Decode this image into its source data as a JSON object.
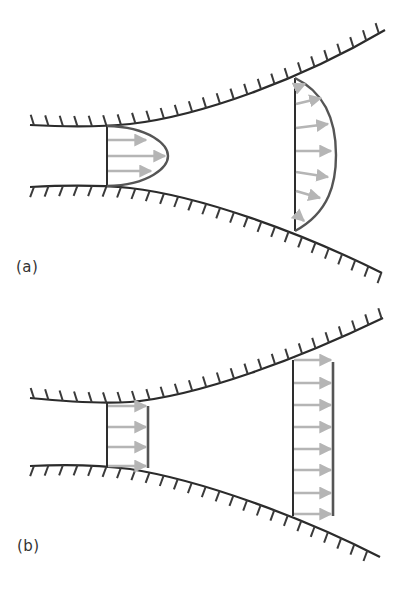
{
  "figure": {
    "colors": {
      "wall": "#2b2b2b",
      "hatch": "#3a3a3a",
      "profile": "#555555",
      "section_line": "#2e2e2e",
      "arrow": "#b5b5b5",
      "background": "#ffffff"
    },
    "panels": [
      {
        "id": "a",
        "label": "(a)",
        "profile_type": "parabolic",
        "inlet": {
          "x": 107,
          "top": 126,
          "bottom": 186,
          "peak_x": 168,
          "arrows": 3
        },
        "outlet": {
          "x": 295,
          "top": 78,
          "bottom": 231,
          "peak_x": 335,
          "arrows": 7
        }
      },
      {
        "id": "b",
        "label": "(b)",
        "profile_type": "uniform",
        "inlet": {
          "x": 107,
          "top": 403,
          "bottom": 467,
          "plug_x": 148,
          "arrows": 4
        },
        "outlet": {
          "x": 293,
          "top": 360,
          "bottom": 516,
          "plug_x": 333,
          "arrows": 8
        }
      }
    ]
  }
}
